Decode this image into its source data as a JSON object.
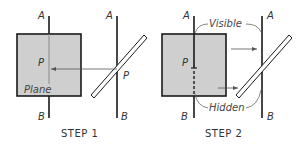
{
  "colors": {
    "plane_fill": "#cfcfcf",
    "line": "#1a1a1a",
    "thin_line": "#555555",
    "background": "#ffffff"
  },
  "step1": {
    "caption": "STEP 1",
    "label_a_left": "A",
    "label_b_left": "B",
    "label_a_right": "A",
    "label_b_right": "B",
    "label_p_left": "P",
    "label_p_right": "P",
    "plane_label": "Plane"
  },
  "step2": {
    "caption": "STEP 2",
    "label_a_left": "A",
    "label_b_left": "B",
    "label_a_right": "A",
    "label_b_right": "B",
    "label_p_left": "P",
    "visible_label": "Visible",
    "hidden_label": "Hidden"
  }
}
